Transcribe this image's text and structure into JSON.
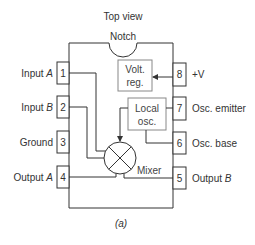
{
  "title": "Top view",
  "notch_label": "Notch",
  "caption": "(a)",
  "colors": {
    "line": "#333333",
    "block_border": "#888888",
    "text": "#333333"
  },
  "left_pins": [
    {
      "number": "1",
      "label": "Input ",
      "label_italic": "A"
    },
    {
      "number": "2",
      "label": "Input ",
      "label_italic": "B"
    },
    {
      "number": "3",
      "label": "Ground",
      "label_italic": ""
    },
    {
      "number": "4",
      "label": "Output ",
      "label_italic": "A"
    }
  ],
  "right_pins": [
    {
      "number": "8",
      "label": "+V",
      "label_italic": ""
    },
    {
      "number": "7",
      "label": "Osc. emitter",
      "label_italic": ""
    },
    {
      "number": "6",
      "label": "Osc. base",
      "label_italic": ""
    },
    {
      "number": "5",
      "label": "Output ",
      "label_italic": "B"
    }
  ],
  "blocks": {
    "volt_reg": {
      "line1": "Volt.",
      "line2": "reg."
    },
    "local_osc": {
      "line1": "Local",
      "line2": "osc."
    },
    "mixer": {
      "label": "Mixer",
      "symbol": "circle-x"
    }
  }
}
